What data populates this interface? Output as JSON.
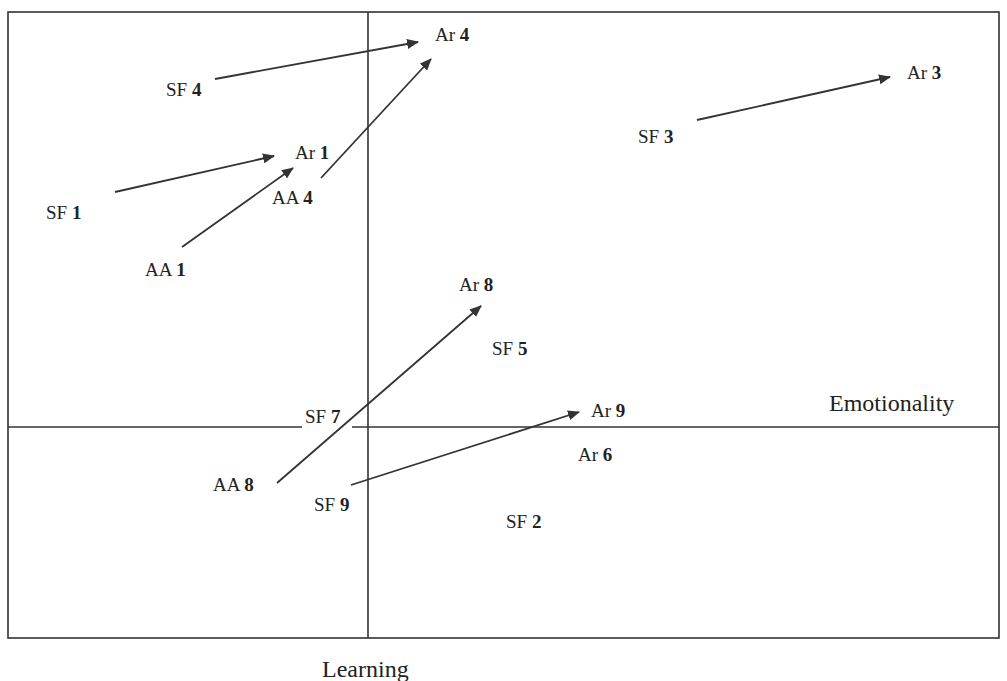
{
  "diagram": {
    "type": "positioning-map",
    "colors": {
      "background": "#ffffff",
      "line": "#333333",
      "text": "#222222"
    },
    "frame": {
      "x1": 8,
      "y1": 12,
      "x2": 999,
      "y2": 638
    },
    "axes": {
      "horizontal": {
        "label": "Emotionality",
        "y": 427,
        "label_pos": {
          "x": 829,
          "y": 411
        }
      },
      "vertical": {
        "label": "Learning",
        "x": 368,
        "label_pos": {
          "x": 322,
          "y": 677
        }
      },
      "horizontal_gap": {
        "x1": 302,
        "x2": 352
      }
    },
    "nodes": [
      {
        "id": "SF4",
        "prefix": "SF",
        "num": "4",
        "x": 166,
        "y": 96
      },
      {
        "id": "Ar4",
        "prefix": "Ar",
        "num": "4",
        "x": 435,
        "y": 41
      },
      {
        "id": "Ar1",
        "prefix": "Ar",
        "num": "1",
        "x": 295,
        "y": 159
      },
      {
        "id": "SF1",
        "prefix": "SF",
        "num": "1",
        "x": 46,
        "y": 219
      },
      {
        "id": "AA4",
        "prefix": "AA",
        "num": "4",
        "x": 272,
        "y": 204
      },
      {
        "id": "AA1",
        "prefix": "AA",
        "num": "1",
        "x": 145,
        "y": 276
      },
      {
        "id": "SF3",
        "prefix": "SF",
        "num": "3",
        "x": 638,
        "y": 143
      },
      {
        "id": "Ar3",
        "prefix": "Ar",
        "num": "3",
        "x": 907,
        "y": 79
      },
      {
        "id": "Ar8",
        "prefix": "Ar",
        "num": "8",
        "x": 459,
        "y": 291
      },
      {
        "id": "SF5",
        "prefix": "SF",
        "num": "5",
        "x": 492,
        "y": 355
      },
      {
        "id": "SF7",
        "prefix": "SF",
        "num": "7",
        "x": 305,
        "y": 423
      },
      {
        "id": "Ar9",
        "prefix": "Ar",
        "num": "9",
        "x": 591,
        "y": 417
      },
      {
        "id": "Ar6",
        "prefix": "Ar",
        "num": "6",
        "x": 578,
        "y": 461
      },
      {
        "id": "AA8",
        "prefix": "AA",
        "num": "8",
        "x": 213,
        "y": 491
      },
      {
        "id": "SF9",
        "prefix": "SF",
        "num": "9",
        "x": 314,
        "y": 511
      },
      {
        "id": "SF2",
        "prefix": "SF",
        "num": "2",
        "x": 506,
        "y": 528
      }
    ],
    "arrows": [
      {
        "from": "SF4",
        "to": "Ar4",
        "x1": 215,
        "y1": 79,
        "x2": 418,
        "y2": 42
      },
      {
        "from": "AA4",
        "to": "Ar4",
        "x1": 321,
        "y1": 178,
        "x2": 431,
        "y2": 59
      },
      {
        "from": "SF1",
        "to": "Ar1",
        "x1": 115,
        "y1": 192,
        "x2": 274,
        "y2": 156
      },
      {
        "from": "AA1",
        "to": "Ar1",
        "x1": 182,
        "y1": 247,
        "x2": 293,
        "y2": 168
      },
      {
        "from": "SF3",
        "to": "Ar3",
        "x1": 697,
        "y1": 120,
        "x2": 890,
        "y2": 77
      },
      {
        "from": "AA8",
        "to": "Ar8",
        "x1": 277,
        "y1": 483,
        "x2": 481,
        "y2": 306
      },
      {
        "from": "SF9",
        "to": "Ar9",
        "x1": 351,
        "y1": 485,
        "x2": 579,
        "y2": 412
      }
    ]
  }
}
